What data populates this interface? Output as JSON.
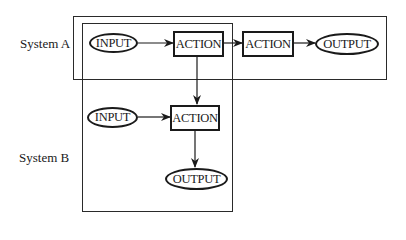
{
  "systems": [
    {
      "label": "System A"
    },
    {
      "label": "System B"
    }
  ],
  "nodes": {
    "a_input": {
      "label": "INPUT",
      "shape": "oval"
    },
    "a_action1": {
      "label": "ACTION",
      "shape": "rectangle"
    },
    "a_action2": {
      "label": "ACTION",
      "shape": "rectangle"
    },
    "a_output": {
      "label": "OUTPUT",
      "shape": "oval"
    },
    "b_input": {
      "label": "INPUT",
      "shape": "oval"
    },
    "b_action": {
      "label": "ACTION",
      "shape": "rectangle"
    },
    "b_output": {
      "label": "OUTPUT",
      "shape": "oval"
    }
  },
  "edges": [
    {
      "from": "a_input",
      "to": "a_action1"
    },
    {
      "from": "a_action1",
      "to": "a_action2"
    },
    {
      "from": "a_action2",
      "to": "a_output"
    },
    {
      "from": "a_action1",
      "to": "b_action"
    },
    {
      "from": "b_input",
      "to": "b_action"
    },
    {
      "from": "b_action",
      "to": "b_output"
    }
  ],
  "colors": {
    "stroke": "#1a1a1a",
    "background": "#ffffff"
  }
}
